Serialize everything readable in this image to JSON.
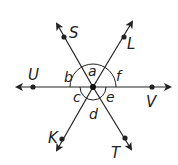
{
  "diagram": {
    "center": {
      "x": 93,
      "y": 87
    },
    "lines": [
      {
        "name": "UV",
        "from": {
          "x": 18,
          "y": 87
        },
        "to": {
          "x": 170,
          "y": 87
        }
      },
      {
        "name": "SKline",
        "from": {
          "x": 57,
          "y": 24
        },
        "to": {
          "x": 131,
          "y": 148
        }
      },
      {
        "name": "LKline",
        "from": {
          "x": 132,
          "y": 22
        },
        "to": {
          "x": 57,
          "y": 150
        }
      }
    ],
    "points": [
      {
        "label": "S",
        "x": 64,
        "y": 37,
        "lx": 69,
        "ly": 38
      },
      {
        "label": "L",
        "x": 124,
        "y": 37,
        "lx": 127,
        "ly": 49
      },
      {
        "label": "U",
        "x": 33,
        "y": 87,
        "lx": 28,
        "ly": 80
      },
      {
        "label": "V",
        "x": 152,
        "y": 87,
        "lx": 146,
        "ly": 107
      },
      {
        "label": "K",
        "x": 62,
        "y": 139,
        "lx": 48,
        "ly": 143
      },
      {
        "label": "T",
        "x": 125,
        "y": 138,
        "lx": 111,
        "ly": 158
      }
    ],
    "angles": [
      {
        "label": "a",
        "x": 90,
        "y": 73
      },
      {
        "label": "b",
        "x": 66,
        "y": 79
      },
      {
        "label": "f",
        "x": 115,
        "y": 79
      },
      {
        "label": "c",
        "x": 74,
        "y": 103
      },
      {
        "label": "e",
        "x": 107,
        "y": 104
      },
      {
        "label": "d",
        "x": 89,
        "y": 121
      }
    ]
  }
}
